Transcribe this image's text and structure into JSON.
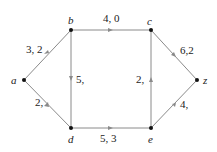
{
  "diagram": {
    "type": "flow-network",
    "colors": {
      "edge": "#8a8a8a",
      "node": "#111111",
      "text": "#222222",
      "background": "#ffffff"
    },
    "nodes": [
      {
        "id": "a",
        "label": "a",
        "x": 24,
        "y": 80
      },
      {
        "id": "b",
        "label": "b",
        "x": 71,
        "y": 30
      },
      {
        "id": "c",
        "label": "c",
        "x": 151,
        "y": 30
      },
      {
        "id": "d",
        "label": "d",
        "x": 71,
        "y": 128
      },
      {
        "id": "e",
        "label": "e",
        "x": 151,
        "y": 128
      },
      {
        "id": "z",
        "label": "z",
        "x": 197,
        "y": 80
      }
    ],
    "edges": [
      {
        "from": "a",
        "to": "b",
        "label": "3, 2"
      },
      {
        "from": "a",
        "to": "d",
        "label": "2,"
      },
      {
        "from": "b",
        "to": "c",
        "label": "4, 0"
      },
      {
        "from": "b",
        "to": "d",
        "label": "5,"
      },
      {
        "from": "d",
        "to": "e",
        "label": "5, 3"
      },
      {
        "from": "e",
        "to": "c",
        "label": "2,"
      },
      {
        "from": "c",
        "to": "z",
        "label": "6,2"
      },
      {
        "from": "e",
        "to": "z",
        "label": "4,"
      }
    ]
  }
}
